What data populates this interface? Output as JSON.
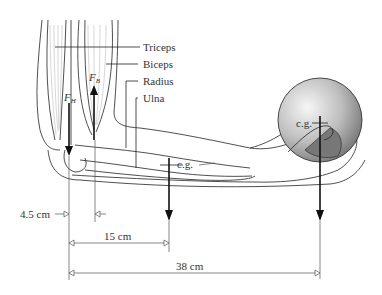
{
  "labels": {
    "triceps": "Triceps",
    "biceps": "Biceps",
    "radius": "Radius",
    "ulna": "Ulna",
    "cg_forearm": "c.g.",
    "cg_ball": "c.g."
  },
  "forces": {
    "fh": {
      "symbol": "F",
      "subscript": "H"
    },
    "fb": {
      "symbol": "F",
      "subscript": "B"
    }
  },
  "dimensions": {
    "d1": "4.5 cm",
    "d2": "15 cm",
    "d3": "38 cm"
  },
  "colors": {
    "line": "#222222",
    "ball_light": "#f4f4f4",
    "ball_dark": "#7a7a7a"
  }
}
